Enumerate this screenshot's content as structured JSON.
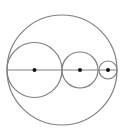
{
  "diagram": {
    "stroke_color": "#808080",
    "point_color": "#111111",
    "background": "#ffffff",
    "outer_circle": {
      "cx": 62,
      "cy": 70,
      "r": 55
    },
    "diameter_line": {
      "x1": 7,
      "y1": 70,
      "x2": 117,
      "y2": 70
    },
    "inner_circles": [
      {
        "cx": 34.5,
        "cy": 70,
        "r": 27.5
      },
      {
        "cx": 80,
        "cy": 70,
        "r": 18
      },
      {
        "cx": 108,
        "cy": 70,
        "r": 9
      }
    ],
    "center_points": [
      {
        "cx": 34.5,
        "cy": 70,
        "r": 2
      },
      {
        "cx": 80,
        "cy": 70,
        "r": 2
      },
      {
        "cx": 108,
        "cy": 70,
        "r": 2
      }
    ]
  }
}
